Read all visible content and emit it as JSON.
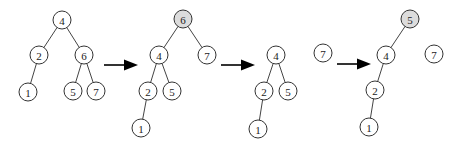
{
  "diagram": {
    "type": "tree-rotation-sequence",
    "node_radius": 9,
    "colors": {
      "node_fill": "#ffffff",
      "highlight_fill": "#dcdcdc",
      "stroke": "#333333",
      "arrow": "#000000"
    },
    "stages": [
      {
        "id": "stage-1",
        "nodes": [
          {
            "id": "s1-4",
            "label": "4",
            "x": 62,
            "y": 20,
            "highlight": false
          },
          {
            "id": "s1-2",
            "label": "2",
            "x": 39,
            "y": 55,
            "highlight": false
          },
          {
            "id": "s1-6",
            "label": "6",
            "x": 84,
            "y": 55,
            "highlight": false
          },
          {
            "id": "s1-1",
            "label": "1",
            "x": 28,
            "y": 92,
            "highlight": false
          },
          {
            "id": "s1-5",
            "label": "5",
            "x": 73,
            "y": 91,
            "highlight": false
          },
          {
            "id": "s1-7",
            "label": "7",
            "x": 96,
            "y": 91,
            "highlight": false
          }
        ],
        "edges": [
          [
            "s1-4",
            "s1-2"
          ],
          [
            "s1-4",
            "s1-6"
          ],
          [
            "s1-2",
            "s1-1"
          ],
          [
            "s1-6",
            "s1-5"
          ],
          [
            "s1-6",
            "s1-7"
          ]
        ]
      },
      {
        "id": "stage-2",
        "nodes": [
          {
            "id": "s2-6",
            "label": "6",
            "x": 183,
            "y": 19,
            "highlight": true
          },
          {
            "id": "s2-4",
            "label": "4",
            "x": 159,
            "y": 55,
            "highlight": false
          },
          {
            "id": "s2-7",
            "label": "7",
            "x": 207,
            "y": 55,
            "highlight": false
          },
          {
            "id": "s2-2",
            "label": "2",
            "x": 148,
            "y": 91,
            "highlight": false
          },
          {
            "id": "s2-5",
            "label": "5",
            "x": 172,
            "y": 91,
            "highlight": false
          },
          {
            "id": "s2-1",
            "label": "1",
            "x": 141,
            "y": 128,
            "highlight": false
          }
        ],
        "edges": [
          [
            "s2-6",
            "s2-4"
          ],
          [
            "s2-6",
            "s2-7"
          ],
          [
            "s2-4",
            "s2-2"
          ],
          [
            "s2-4",
            "s2-5"
          ],
          [
            "s2-2",
            "s2-1"
          ]
        ]
      },
      {
        "id": "stage-3",
        "nodes": [
          {
            "id": "s3-4",
            "label": "4",
            "x": 276,
            "y": 55,
            "highlight": false
          },
          {
            "id": "s3-2",
            "label": "2",
            "x": 264,
            "y": 91,
            "highlight": false
          },
          {
            "id": "s3-5",
            "label": "5",
            "x": 288,
            "y": 91,
            "highlight": false
          },
          {
            "id": "s3-1",
            "label": "1",
            "x": 258,
            "y": 129,
            "highlight": false
          },
          {
            "id": "s3-7",
            "label": "7",
            "x": 323,
            "y": 53,
            "highlight": false
          }
        ],
        "edges": [
          [
            "s3-4",
            "s3-2"
          ],
          [
            "s3-4",
            "s3-5"
          ],
          [
            "s3-2",
            "s3-1"
          ]
        ]
      },
      {
        "id": "stage-4",
        "nodes": [
          {
            "id": "s4-5",
            "label": "5",
            "x": 410,
            "y": 19,
            "highlight": true
          },
          {
            "id": "s4-4",
            "label": "4",
            "x": 386,
            "y": 55,
            "highlight": false
          },
          {
            "id": "s4-7",
            "label": "7",
            "x": 434,
            "y": 54,
            "highlight": false
          },
          {
            "id": "s4-2",
            "label": "2",
            "x": 375,
            "y": 90,
            "highlight": false
          },
          {
            "id": "s4-1",
            "label": "1",
            "x": 369,
            "y": 127,
            "highlight": false
          }
        ],
        "edges": [
          [
            "s4-5",
            "s4-4"
          ],
          [
            "s4-4",
            "s4-2"
          ],
          [
            "s4-2",
            "s4-1"
          ]
        ]
      }
    ],
    "arrows": [
      {
        "id": "arrow-1",
        "x1": 104,
        "x2": 138,
        "y": 65
      },
      {
        "id": "arrow-2",
        "x1": 221,
        "x2": 255,
        "y": 65
      },
      {
        "id": "arrow-3",
        "x1": 337,
        "x2": 371,
        "y": 64
      }
    ]
  }
}
